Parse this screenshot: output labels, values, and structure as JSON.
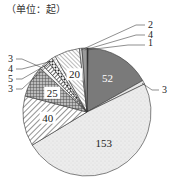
{
  "unit_label": "（单位：起）",
  "chart_data": {
    "type": "pie",
    "title": "",
    "unit": "起",
    "start_angle": "12 o'clock",
    "direction": "clockwise",
    "values": [
      1,
      52,
      3,
      153,
      40,
      25,
      3,
      5,
      4,
      3,
      20,
      2,
      4
    ],
    "labels": [
      "1",
      "52",
      "3",
      "153",
      "40",
      "25",
      "3",
      "5",
      "4",
      "3",
      "20",
      "2",
      "4"
    ],
    "label_placement": [
      "outside",
      "inside",
      "outside",
      "inside",
      "inside",
      "inside",
      "outside",
      "outside",
      "outside",
      "outside",
      "inside",
      "outside",
      "outside"
    ],
    "fills": [
      "#2a2a2a",
      "#7a7a7a",
      "#e6e6e6",
      "#ededed",
      "hatch-diag",
      "crosshatch",
      "#f5f5f5",
      "hatch-dense",
      "dots",
      "hatch-light",
      "hatch-fine",
      "#dddddd",
      "#9a9a9a"
    ],
    "total": 315,
    "legend": "none"
  }
}
